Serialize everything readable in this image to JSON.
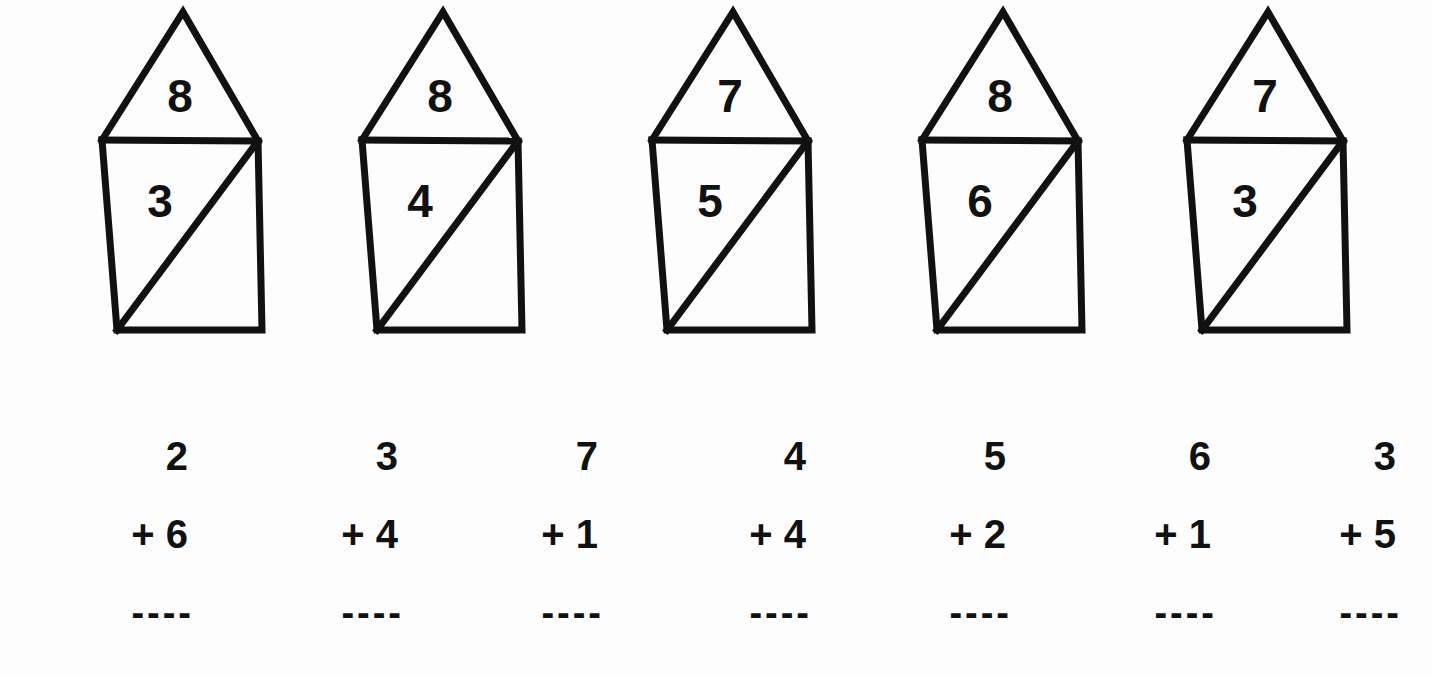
{
  "page": {
    "background_color": "#fdfdfd",
    "ink_color": "#111111"
  },
  "shapes_row": {
    "label": "pentagon-house-figures",
    "description": "Five pentagon figures each split into a top triangle and a bottom trapezoid with a diagonal; each region holds a number.",
    "figures": [
      {
        "id": "figure-1",
        "top_number": "8",
        "bottom_number": "3"
      },
      {
        "id": "figure-2",
        "top_number": "8",
        "bottom_number": "4"
      },
      {
        "id": "figure-3",
        "top_number": "7",
        "bottom_number": "5"
      },
      {
        "id": "figure-4",
        "top_number": "8",
        "bottom_number": "6"
      },
      {
        "id": "figure-5",
        "top_number": "7",
        "bottom_number": "3"
      }
    ]
  },
  "problems_row": {
    "label": "addition-problems",
    "rule_dashes": "----",
    "problems": [
      {
        "id": "problem-1",
        "addend_top": "2",
        "operator": "+",
        "addend_bottom": "6",
        "operator_line": "+ 6"
      },
      {
        "id": "problem-2",
        "addend_top": "3",
        "operator": "+",
        "addend_bottom": "4",
        "operator_line": "+ 4"
      },
      {
        "id": "problem-3",
        "addend_top": "7",
        "operator": "+",
        "addend_bottom": "1",
        "operator_line": "+ 1"
      },
      {
        "id": "problem-4",
        "addend_top": "4",
        "operator": "+",
        "addend_bottom": "4",
        "operator_line": "+ 4"
      },
      {
        "id": "problem-5",
        "addend_top": "5",
        "operator": "+",
        "addend_bottom": "2",
        "operator_line": "+ 2"
      },
      {
        "id": "problem-6",
        "addend_top": "6",
        "operator": "+",
        "addend_bottom": "1",
        "operator_line": "+ 1"
      },
      {
        "id": "problem-7",
        "addend_top": "3",
        "operator": "+",
        "addend_bottom": "5",
        "operator_line": "+ 5"
      }
    ]
  }
}
